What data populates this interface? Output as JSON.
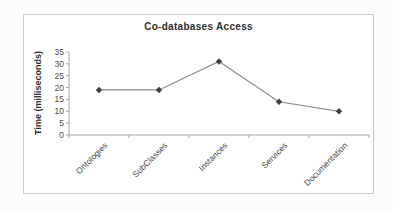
{
  "chart_data": {
    "type": "line",
    "title": "Co-databases Access",
    "ylabel": "Time (milliseconds)",
    "xlabel": "",
    "categories": [
      "Ontologies",
      "SubClasses",
      "Instances",
      "Services",
      "Documentation"
    ],
    "values": [
      19,
      19,
      31,
      14,
      10
    ],
    "ylim": [
      0,
      35
    ],
    "yticks": [
      0,
      5,
      10,
      15,
      20,
      25,
      30,
      35
    ],
    "grid": false,
    "legend": "none",
    "marker": "diamond",
    "colors": {
      "line": "#8c8c8c",
      "marker": "#3f3f3f",
      "axis": "#a6a6a6",
      "tick_text": "#4a4a4a",
      "title_text": "#2f2f2f",
      "frame_border": "#cbcbcb",
      "plot_background": "#ffffff"
    }
  }
}
